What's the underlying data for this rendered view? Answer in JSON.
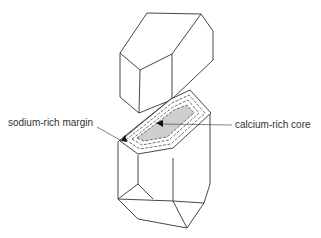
{
  "labels": {
    "margin": "sodium-rich margin",
    "core": "calcium-rich core"
  },
  "colors": {
    "line": "#333333",
    "core_fill": "#cfcfcf",
    "background": "#ffffff"
  }
}
